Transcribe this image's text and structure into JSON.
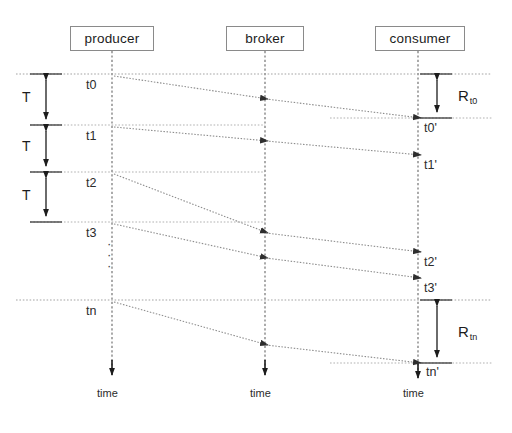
{
  "diagram": {
    "actors": [
      {
        "name": "producer",
        "label": "producer",
        "lifeline_x": 112,
        "box_left": 70,
        "box_top": 26,
        "box_width": 84,
        "box_height": 25
      },
      {
        "name": "broker",
        "label": "broker",
        "lifeline_x": 265,
        "box_left": 226,
        "box_top": 26,
        "box_width": 78,
        "box_height": 25
      },
      {
        "name": "consumer",
        "label": "consumer",
        "lifeline_x": 418,
        "box_left": 375,
        "box_top": 26,
        "box_width": 90,
        "box_height": 25
      }
    ],
    "producer_events": [
      {
        "label": "t0",
        "y": 74
      },
      {
        "label": "t1",
        "y": 125
      },
      {
        "label": "t2",
        "y": 172
      },
      {
        "label": "t3",
        "y": 222
      },
      {
        "label": "tn",
        "y": 300
      }
    ],
    "consumer_events": [
      {
        "label": "t0'",
        "y": 118
      },
      {
        "label": "t1'",
        "y": 155
      },
      {
        "label": "t2'",
        "y": 252
      },
      {
        "label": "t3'",
        "y": 278
      },
      {
        "label": "tn'",
        "y": 363
      }
    ],
    "interval_labels": [
      {
        "label": "T",
        "x": 28,
        "y": 97
      },
      {
        "label": "T",
        "x": 28,
        "y": 146
      },
      {
        "label": "T",
        "x": 28,
        "y": 195
      }
    ],
    "latency_labels": [
      {
        "label": "R",
        "sub": "t0",
        "x": 446,
        "y": 95
      },
      {
        "label": "R",
        "sub": "tn",
        "x": 446,
        "y": 332
      }
    ],
    "axis_labels": [
      {
        "label": "time",
        "x": 112,
        "y": 390
      },
      {
        "label": "time",
        "x": 265,
        "y": 390
      },
      {
        "label": "time",
        "x": 418,
        "y": 390
      }
    ],
    "ellipsis": {
      "label": "·\n·\n·",
      "x": 112,
      "y": 245
    },
    "messages": [
      {
        "from": "t0",
        "to": "t0'",
        "via": "broker"
      },
      {
        "from": "t1",
        "to": "t1'",
        "via": "broker"
      },
      {
        "from": "t2",
        "to": "t2'",
        "via": "broker"
      },
      {
        "from": "t3",
        "to": "t3'",
        "via": "broker"
      },
      {
        "from": "tn",
        "to": "tn'",
        "via": "broker"
      }
    ],
    "colors": {
      "line": "#6b6b6b",
      "box_border": "#8a8a8a",
      "text": "#1c1c1c",
      "lifeline": "#555555",
      "dashed": "#9a9a9a",
      "background": "#ffffff"
    }
  }
}
